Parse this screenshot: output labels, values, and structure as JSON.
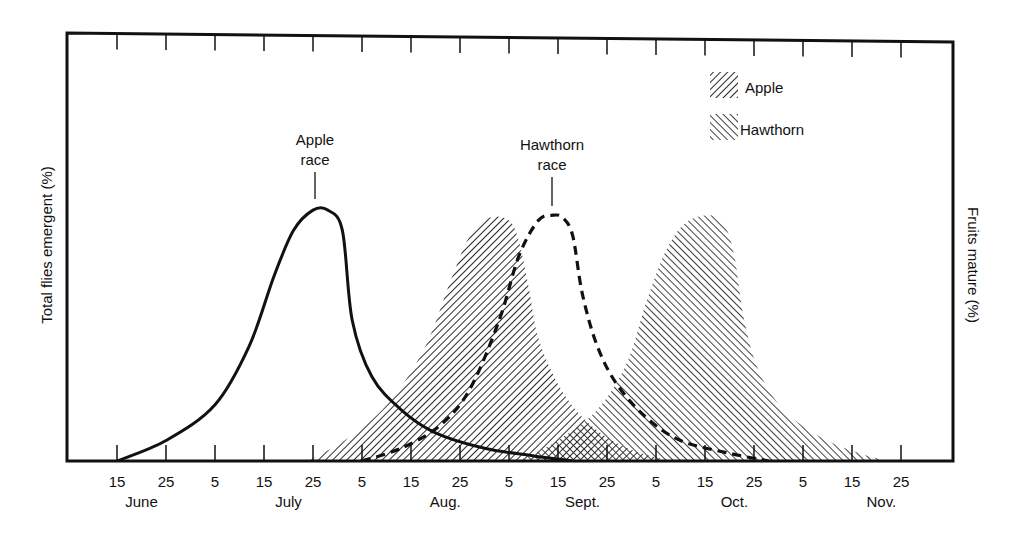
{
  "chart_data": {
    "type": "area",
    "title": "",
    "xlabel": "",
    "ylabel_left": "Total flies emergent (%)",
    "ylabel_right": "Fruits mature (%)",
    "x_tick_labels": [
      "15",
      "25",
      "5",
      "15",
      "25",
      "5",
      "15",
      "25",
      "5",
      "15",
      "25",
      "5",
      "15",
      "25",
      "5",
      "15",
      "25"
    ],
    "month_labels": [
      {
        "label": "June",
        "center_tick": 0.5
      },
      {
        "label": "July",
        "center_tick": 3.5
      },
      {
        "label": "Aug.",
        "center_tick": 6.7
      },
      {
        "label": "Sept.",
        "center_tick": 9.5
      },
      {
        "label": "Oct.",
        "center_tick": 12.6
      },
      {
        "label": "Nov.",
        "center_tick": 15.6
      }
    ],
    "x_units": "days since June 15 (tick every 10 days)",
    "x_range": [
      0,
      160
    ],
    "y_range": [
      0,
      100
    ],
    "grid": false,
    "legend_position": "upper right",
    "legend": [
      {
        "label": "Apple",
        "pattern": "forward-hatch"
      },
      {
        "label": "Hawthorn",
        "pattern": "back-hatch"
      }
    ],
    "annotations": [
      {
        "text": [
          "Apple",
          "race"
        ],
        "points_to": "Apple race peak"
      },
      {
        "text": [
          "Hawthorn",
          "race"
        ],
        "points_to": "Hawthorn race peak"
      }
    ],
    "series": [
      {
        "name": "Apple race (flies emergent)",
        "style": "solid-line",
        "x": [
          0,
          10,
          20,
          27,
          32,
          36,
          40,
          43,
          46,
          48,
          52,
          58,
          65,
          75,
          85,
          93
        ],
        "y": [
          0,
          8,
          22,
          45,
          72,
          90,
          98,
          98,
          90,
          55,
          33,
          20,
          11,
          5,
          2,
          0
        ]
      },
      {
        "name": "Hawthorn race (flies emergent)",
        "style": "dashed-line",
        "x": [
          50,
          58,
          66,
          72,
          78,
          82,
          86,
          89,
          91,
          93,
          95,
          98,
          102,
          108,
          115,
          125,
          133
        ],
        "y": [
          0,
          5,
          14,
          28,
          55,
          80,
          94,
          96,
          95,
          88,
          65,
          45,
          30,
          17,
          8,
          3,
          0
        ]
      },
      {
        "name": "Apple fruits mature",
        "style": "forward-hatch-area",
        "x": [
          39,
          48,
          56,
          63,
          68,
          72,
          76,
          80,
          82,
          84,
          86,
          90,
          95,
          101,
          107,
          113
        ],
        "y": [
          0,
          10,
          24,
          45,
          70,
          88,
          95,
          94,
          86,
          68,
          48,
          30,
          17,
          8,
          3,
          0
        ]
      },
      {
        "name": "Hawthorn fruits mature",
        "style": "back-hatch-area",
        "x": [
          82,
          90,
          98,
          104,
          108,
          112,
          116,
          121,
          124,
          126,
          128,
          131,
          136,
          143,
          150,
          157
        ],
        "y": [
          0,
          8,
          20,
          38,
          62,
          82,
          93,
          96,
          92,
          80,
          55,
          35,
          20,
          10,
          4,
          0
        ]
      }
    ]
  },
  "plot_area": {
    "left": 67,
    "top": 36,
    "right": 953,
    "bottom": 461,
    "px_per_day": 4.9,
    "x0_px": 117
  }
}
